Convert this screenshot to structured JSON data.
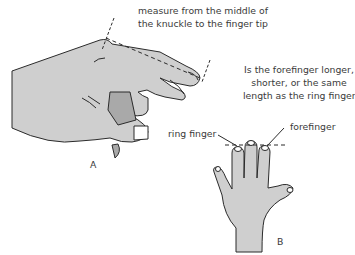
{
  "figure": {
    "panel_a": {
      "label": "A",
      "caption_lines": [
        "measure from the middle of",
        "the knuckle to the finger tip"
      ]
    },
    "panel_b": {
      "label": "B",
      "question_lines": [
        "Is the forefinger longer,",
        "shorter, or the same",
        "length as the ring finger?"
      ],
      "callouts": {
        "ring_finger": "ring finger",
        "forefinger": "forefinger"
      }
    },
    "colors": {
      "skin": "#cfcfcf",
      "skin_dark": "#a9a9a9",
      "outline": "#2b2b2b",
      "text": "#3a3a3a"
    },
    "cut_off_text": "(partially visible text)"
  }
}
